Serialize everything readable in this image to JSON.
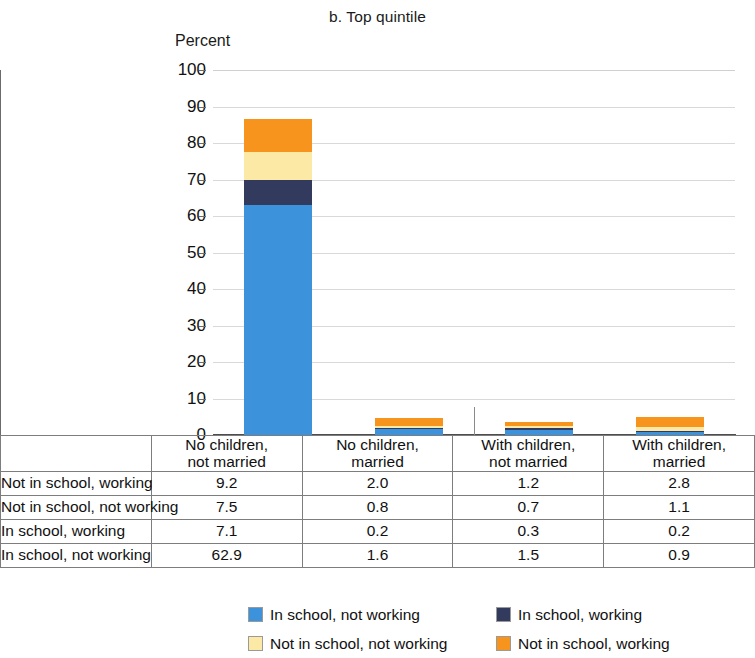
{
  "chart_data": {
    "type": "bar",
    "subtype": "stacked-column",
    "title": "b. Top quintile",
    "xlabel": "",
    "ylabel": "Percent",
    "ylim": [
      0,
      100
    ],
    "yticks": [
      0,
      10,
      20,
      30,
      40,
      50,
      60,
      70,
      80,
      90,
      100
    ],
    "grid": true,
    "legend_position": "bottom",
    "categories": [
      "No children, not married",
      "No children, married",
      "With children, not married",
      "With children, married"
    ],
    "category_lines": [
      [
        "No children,",
        "not married"
      ],
      [
        "No children,",
        "married"
      ],
      [
        "With children,",
        "not married"
      ],
      [
        "With children,",
        "married"
      ]
    ],
    "stack_order_bottom_to_top": [
      "In school, not working",
      "In school, working",
      "Not in school, not working",
      "Not in school, working"
    ],
    "series": [
      {
        "name": "Not in school, working",
        "values": [
          9.2,
          2.0,
          1.2,
          2.8
        ],
        "color": "#F7941E"
      },
      {
        "name": "Not in school, not working",
        "values": [
          7.5,
          0.8,
          0.7,
          1.1
        ],
        "color": "#FBE9A5"
      },
      {
        "name": "In school, working",
        "values": [
          7.1,
          0.2,
          0.3,
          0.2
        ],
        "color": "#323B5E"
      },
      {
        "name": "In school, not working",
        "values": [
          62.9,
          1.6,
          1.5,
          0.9
        ],
        "color": "#3C92DB"
      }
    ],
    "totals": [
      86.7,
      4.6,
      3.7,
      5.0
    ]
  },
  "table": {
    "column_headers": [
      "No children, not married",
      "No children, married",
      "With children, not married",
      "With children, married"
    ],
    "rows": [
      {
        "label": "Not in school, working",
        "values": [
          "9.2",
          "2.0",
          "1.2",
          "2.8"
        ]
      },
      {
        "label": "Not in school, not working",
        "values": [
          "7.5",
          "0.8",
          "0.7",
          "1.1"
        ]
      },
      {
        "label": "In school, working",
        "values": [
          "7.1",
          "0.2",
          "0.3",
          "0.2"
        ]
      },
      {
        "label": "In school, not working",
        "values": [
          "62.9",
          "1.6",
          "1.5",
          "0.9"
        ]
      }
    ]
  },
  "legend": {
    "items": [
      {
        "label": "In school, not working",
        "color": "#3C92DB"
      },
      {
        "label": "In school, working",
        "color": "#323B5E"
      },
      {
        "label": "Not in school, not working",
        "color": "#FBE9A5"
      },
      {
        "label": "Not in school, working",
        "color": "#F7941E"
      }
    ]
  }
}
